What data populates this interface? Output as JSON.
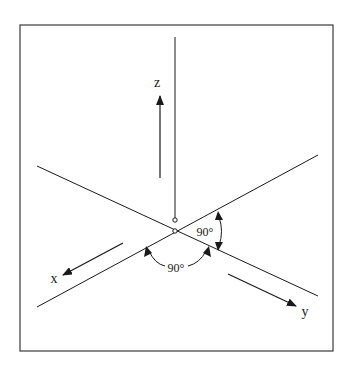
{
  "figure": {
    "type": "coordinate-system-diagram",
    "border": {
      "x": 20,
      "y": 25,
      "width": 313,
      "height": 326,
      "color": "#3a3a3a"
    },
    "line_color": "#1a1a1a",
    "origin": {
      "x": 175,
      "y": 231
    },
    "axes": [
      {
        "name": "z",
        "label": "z",
        "axis_line": {
          "x1": 175,
          "y1": 37,
          "x2": 175,
          "y2": 220
        },
        "direction_arrow": {
          "x1": 160,
          "y1": 178,
          "x2": 160,
          "y2": 96
        },
        "label_pos": {
          "x": 157,
          "y": 87
        }
      },
      {
        "name": "x",
        "label": "x",
        "axis_line": {
          "x1": 37,
          "y1": 307,
          "x2": 318,
          "y2": 155
        },
        "direction_arrow": {
          "x1": 123,
          "y1": 243,
          "x2": 63,
          "y2": 275
        },
        "label_pos": {
          "x": 54,
          "y": 283
        }
      },
      {
        "name": "y",
        "label": "y",
        "axis_line": {
          "x1": 37,
          "y1": 166,
          "x2": 318,
          "y2": 296
        },
        "direction_arrow": {
          "x1": 228,
          "y1": 274,
          "x2": 296,
          "y2": 306
        },
        "label_pos": {
          "x": 304,
          "y": 316
        }
      }
    ],
    "angle_annotations": [
      {
        "name": "angle-between-x-and-y-bottom",
        "label": "90°",
        "label_pos": {
          "x": 176,
          "y": 272
        },
        "arc_start": {
          "x": 147,
          "y": 247
        },
        "arc_end": {
          "x": 208,
          "y": 248
        }
      },
      {
        "name": "angle-right",
        "label": "90°",
        "label_pos": {
          "x": 205,
          "y": 236
        },
        "arc_start": {
          "x": 218,
          "y": 213
        },
        "arc_end": {
          "x": 218,
          "y": 250
        }
      }
    ],
    "markers": [
      {
        "name": "z-axis-end-circle",
        "x": 175,
        "y": 220,
        "r": 2.2
      },
      {
        "name": "origin-circle",
        "x": 175,
        "y": 231,
        "r": 2.2
      }
    ]
  }
}
